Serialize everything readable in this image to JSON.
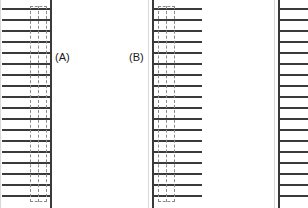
{
  "figure": {
    "width": 308,
    "height": 208,
    "background": "#ffffff",
    "line_color": "#3a3a3a",
    "dash_color": "#8a8a8a",
    "text_color": "#1a1a1a"
  },
  "labels": [
    {
      "id": "label-a",
      "text": "(A)",
      "x": 55,
      "y": 52
    },
    {
      "id": "label-b",
      "text": "(B)",
      "x": 129,
      "y": 52
    }
  ],
  "panels": [
    {
      "id": "panel-left",
      "orientation": "rungs-left",
      "spine_x": 50,
      "rung_left": 2,
      "rung_right": 50,
      "rung_count": 18,
      "rung_top": 8,
      "rung_pitch": 11,
      "dashbox": {
        "x": 30,
        "y": 6,
        "w": 17,
        "h": 196
      },
      "dashcenter_x": 38
    },
    {
      "id": "panel-middle",
      "orientation": "rungs-right",
      "spine_x": 152,
      "rung_left": 152,
      "rung_right": 202,
      "rung_count": 18,
      "rung_top": 8,
      "rung_pitch": 11,
      "dashbox": {
        "x": 158,
        "y": 6,
        "w": 17,
        "h": 196
      },
      "dashcenter_x": 166
    },
    {
      "id": "panel-right",
      "orientation": "rungs-right",
      "spine_x": 278,
      "rung_left": 278,
      "rung_right": 308,
      "rung_count": 18,
      "rung_top": 8,
      "rung_pitch": 11,
      "dashbox": null,
      "dashcenter_x": null
    }
  ],
  "hairlines": [
    {
      "id": "hairline-left-edge",
      "x": 0
    },
    {
      "id": "hairline-panel-middle-outer",
      "x": 148
    },
    {
      "id": "hairline-panel-right-outer",
      "x": 274
    }
  ]
}
